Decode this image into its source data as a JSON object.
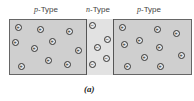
{
  "labels": {
    "left": {
      "letter": "p",
      "suffix": "-Type"
    },
    "middle": {
      "letter": "n",
      "suffix": "-Type"
    },
    "right": {
      "letter": "p",
      "suffix": "-Type"
    }
  },
  "caption": "(a)",
  "carriers": {
    "left_p": {
      "symbol": "+",
      "positions": [
        [
          18,
          27
        ],
        [
          40,
          29
        ],
        [
          69,
          31
        ],
        [
          15,
          42
        ],
        [
          34,
          48
        ],
        [
          52,
          41
        ],
        [
          78,
          50
        ],
        [
          48,
          60
        ],
        [
          67,
          64
        ],
        [
          21,
          66
        ]
      ]
    },
    "n": {
      "symbol": "−",
      "positions": [
        [
          92,
          25
        ],
        [
          107,
          39
        ],
        [
          97,
          47
        ],
        [
          106,
          58
        ],
        [
          92,
          64
        ]
      ]
    },
    "right_p": {
      "symbol": "+",
      "positions": [
        [
          122,
          27
        ],
        [
          157,
          29
        ],
        [
          176,
          33
        ],
        [
          124,
          44
        ],
        [
          139,
          40
        ],
        [
          159,
          47
        ],
        [
          144,
          57
        ],
        [
          181,
          55
        ],
        [
          127,
          66
        ],
        [
          160,
          66
        ]
      ]
    }
  },
  "colors": {
    "p_region": "#cfcfcf",
    "n_region": "#e2e2e2",
    "border": "#555555"
  }
}
